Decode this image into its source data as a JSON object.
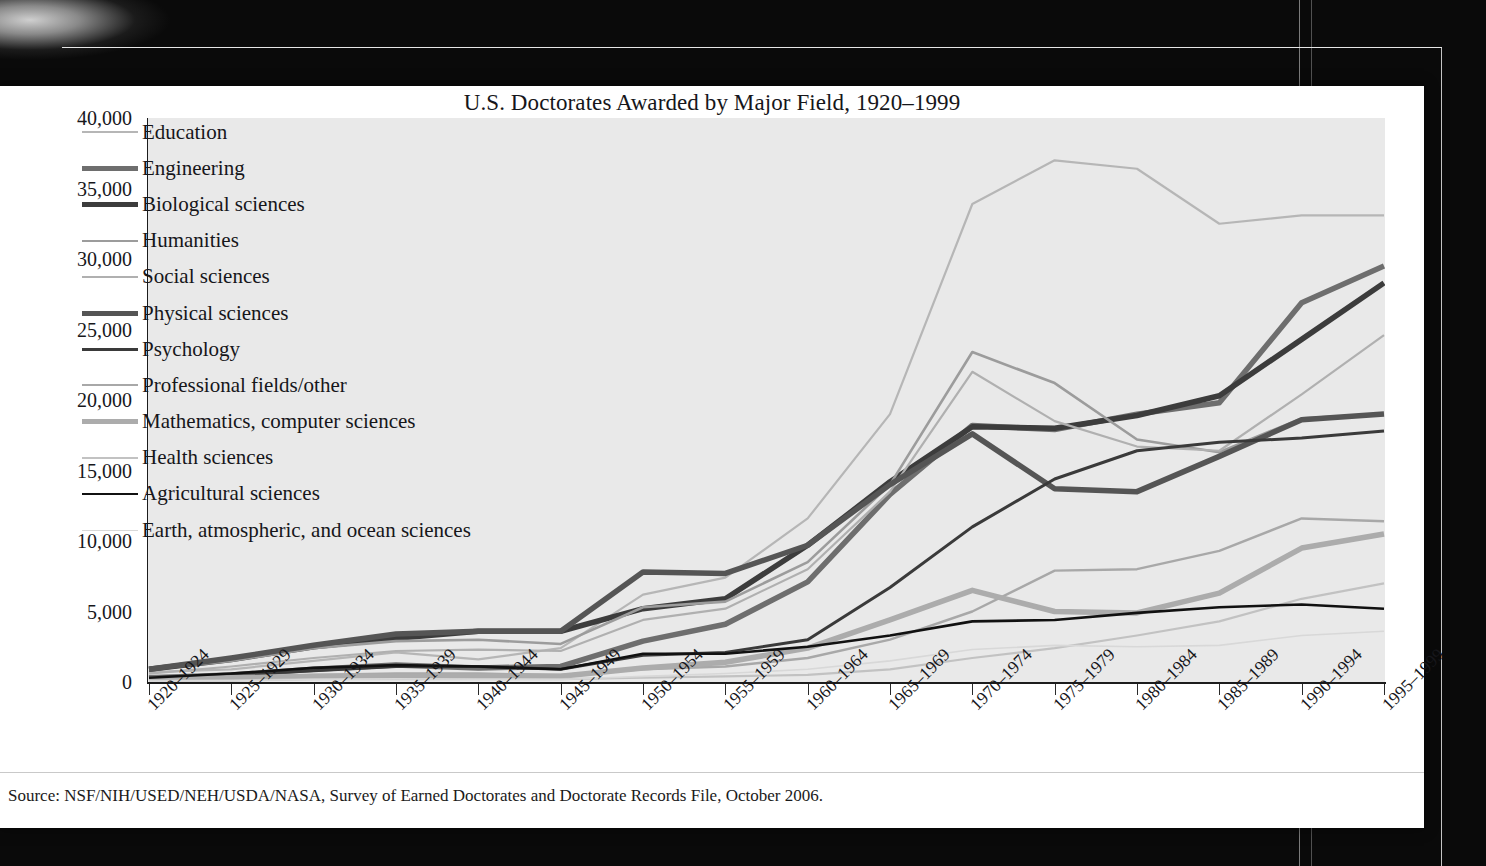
{
  "chart_title": "U.S. Doctorates Awarded by Major Field, 1920–1999",
  "source_note": "Source: NSF/NIH/USED/NEH/USDA/NASA, Survey of Earned Doctorates and Doctorate Records File, October 2006.",
  "colors": {
    "page_background": "#ffffff",
    "plot_background": "#e9e9e9",
    "axis": "#1c1c1c",
    "text": "#16161a",
    "surround": "#070707"
  },
  "legend": {
    "position": "inside-top-left",
    "entries": [
      {
        "label": "Education",
        "color": "#b6b6b6",
        "width": 2.2
      },
      {
        "label": "Engineering",
        "color": "#6e6e6e",
        "width": 5.5
      },
      {
        "label": "Biological sciences",
        "color": "#3c3c3c",
        "width": 5.5
      },
      {
        "label": "Humanities",
        "color": "#9c9c9c",
        "width": 2.6
      },
      {
        "label": "Social sciences",
        "color": "#b0b0b0",
        "width": 2.2
      },
      {
        "label": "Physical sciences",
        "color": "#555555",
        "width": 5.5
      },
      {
        "label": "Psychology",
        "color": "#3a3a3a",
        "width": 3.0
      },
      {
        "label": "Professional fields/other",
        "color": "#a8a8a8",
        "width": 2.4
      },
      {
        "label": "Mathematics, computer sciences",
        "color": "#acacac",
        "width": 5.5
      },
      {
        "label": "Health sciences",
        "color": "#c2c2c2",
        "width": 2.2
      },
      {
        "label": "Agricultural sciences",
        "color": "#111111",
        "width": 2.6
      },
      {
        "label": "Earth, atmospheric, and ocean sciences",
        "color": "#d8d8d8",
        "width": 1.6
      }
    ]
  },
  "chart_data": {
    "type": "line",
    "title": "U.S. Doctorates Awarded by Major Field, 1920–1999",
    "xlabel": "",
    "ylabel": "",
    "ylim": [
      0,
      40000
    ],
    "yticks": [
      0,
      5000,
      10000,
      15000,
      20000,
      25000,
      30000,
      35000,
      40000
    ],
    "ytick_labels": [
      "0",
      "5,000",
      "10,000",
      "15,000",
      "20,000",
      "25,000",
      "30,000",
      "35,000",
      "40,000"
    ],
    "grid": false,
    "legend_position": "inside upper left",
    "categories": [
      "1920–1924",
      "1925–1929",
      "1930–1934",
      "1935–1939",
      "1940–1944",
      "1945–1949",
      "1950–1954",
      "1955–1959",
      "1960–1964",
      "1965–1969",
      "1970–1974",
      "1975–1979",
      "1980–1984",
      "1985–1989",
      "1990–1994",
      "1995–1999"
    ],
    "series": [
      {
        "name": "Education",
        "color": "#b6b6b6",
        "width": 2.2,
        "values": [
          700,
          900,
          1500,
          2100,
          1600,
          2400,
          6200,
          7400,
          11600,
          19000,
          33900,
          37000,
          36400,
          32500,
          33100,
          33100
        ]
      },
      {
        "name": "Engineering",
        "color": "#6e6e6e",
        "width": 5.5,
        "values": [
          300,
          500,
          900,
          1200,
          1000,
          1100,
          2900,
          4100,
          7100,
          13300,
          18200,
          17900,
          19000,
          19800,
          26900,
          29500
        ]
      },
      {
        "name": "Biological sciences",
        "color": "#3c3c3c",
        "width": 5.5,
        "values": [
          900,
          1600,
          2500,
          3100,
          3600,
          3600,
          5200,
          5900,
          9700,
          14200,
          18100,
          18000,
          18900,
          20300,
          24300,
          28300
        ]
      },
      {
        "name": "Humanities",
        "color": "#9c9c9c",
        "width": 2.6,
        "values": [
          900,
          1500,
          2400,
          2900,
          3000,
          2700,
          5300,
          5700,
          8500,
          14000,
          23400,
          21200,
          17200,
          16300,
          18700,
          19000
        ]
      },
      {
        "name": "Social sciences",
        "color": "#b0b0b0",
        "width": 2.2,
        "values": [
          600,
          1100,
          1700,
          2200,
          2300,
          2200,
          4400,
          5200,
          8000,
          13500,
          22000,
          18500,
          16700,
          16400,
          20400,
          24600
        ]
      },
      {
        "name": "Physical sciences",
        "color": "#555555",
        "width": 5.5,
        "values": [
          900,
          1700,
          2600,
          3400,
          3600,
          3600,
          7800,
          7700,
          9700,
          14000,
          17600,
          13700,
          13500,
          16000,
          18600,
          19000
        ]
      },
      {
        "name": "Psychology",
        "color": "#3a3a3a",
        "width": 3.0,
        "values": [
          300,
          500,
          800,
          1100,
          1100,
          900,
          1900,
          2100,
          3000,
          6700,
          11000,
          14400,
          16400,
          17000,
          17300,
          17800
        ]
      },
      {
        "name": "Professional fields/other",
        "color": "#a8a8a8",
        "width": 2.4,
        "values": [
          200,
          300,
          500,
          600,
          600,
          500,
          900,
          1100,
          1700,
          3000,
          5000,
          7900,
          8000,
          9300,
          11600,
          11400
        ]
      },
      {
        "name": "Mathematics, computer sciences",
        "color": "#acacac",
        "width": 5.5,
        "values": [
          200,
          300,
          400,
          400,
          400,
          400,
          1000,
          1400,
          2400,
          4400,
          6500,
          5000,
          4900,
          6300,
          9500,
          10500
        ]
      },
      {
        "name": "Health sciences",
        "color": "#c2c2c2",
        "width": 2.2,
        "values": [
          100,
          100,
          200,
          200,
          200,
          200,
          300,
          400,
          500,
          900,
          1700,
          2400,
          3300,
          4300,
          5900,
          7000
        ]
      },
      {
        "name": "Agricultural sciences",
        "color": "#111111",
        "width": 2.6,
        "values": [
          300,
          600,
          1000,
          1200,
          1100,
          900,
          2000,
          2000,
          2500,
          3300,
          4300,
          4400,
          4900,
          5300,
          5500,
          5200
        ]
      },
      {
        "name": "Earth, atmospheric, and ocean sciences",
        "color": "#d8d8d8",
        "width": 1.6,
        "values": [
          60,
          100,
          180,
          220,
          200,
          180,
          400,
          600,
          900,
          1500,
          2300,
          2600,
          2500,
          2600,
          3300,
          3600
        ]
      }
    ]
  }
}
